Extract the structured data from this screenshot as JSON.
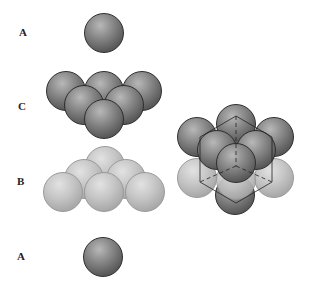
{
  "labels": {
    "top_a": "A",
    "layer_c": "C",
    "layer_b": "B",
    "bottom_a": "A"
  },
  "colors": {
    "dark_sphere": "#6e6e6e",
    "light_sphere": "#bdbdbd",
    "outline": "#222222"
  }
}
